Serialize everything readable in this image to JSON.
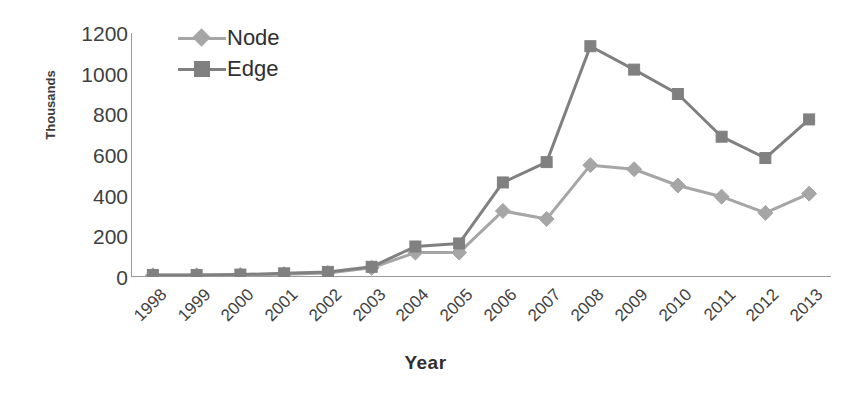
{
  "chart_data": {
    "type": "line",
    "title": "",
    "xlabel": "Year",
    "ylabel": "Thousands",
    "categories": [
      "1998",
      "1999",
      "2000",
      "2001",
      "2002",
      "2003",
      "2004",
      "2005",
      "2006",
      "2007",
      "2008",
      "2009",
      "2010",
      "2011",
      "2012",
      "2013"
    ],
    "series": [
      {
        "name": "Node",
        "color": "#a6a6a6",
        "marker": "diamond",
        "values": [
          8,
          8,
          10,
          14,
          20,
          45,
          120,
          120,
          325,
          285,
          550,
          530,
          450,
          395,
          315,
          410
        ]
      },
      {
        "name": "Edge",
        "color": "#808080",
        "marker": "square",
        "values": [
          10,
          10,
          12,
          18,
          25,
          50,
          150,
          165,
          465,
          565,
          1135,
          1020,
          900,
          690,
          585,
          775
        ]
      }
    ],
    "ylim": [
      0,
      1200
    ],
    "yticks": [
      0,
      200,
      400,
      600,
      800,
      1000,
      1200
    ],
    "ytick_labels": [
      "0",
      "200",
      "400",
      "600",
      "800",
      "1000",
      "1200"
    ],
    "grid": false,
    "legend_position": "top-left-inside",
    "axis_color": "#9a9a9a",
    "text_color": "#3f3f3f"
  },
  "legend": {
    "items": [
      {
        "label": "Node"
      },
      {
        "label": "Edge"
      }
    ]
  }
}
